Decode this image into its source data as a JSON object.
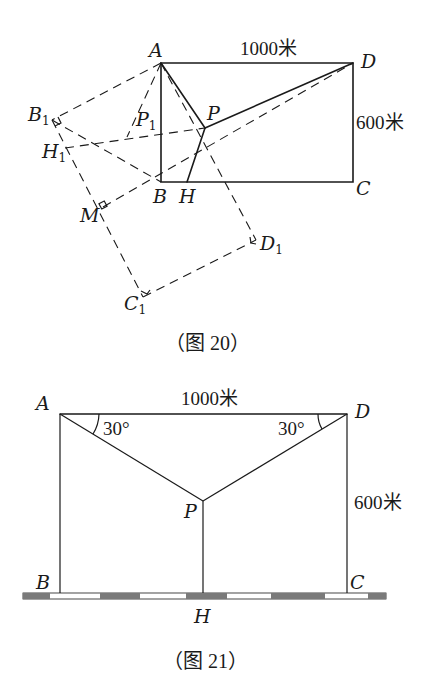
{
  "figure20": {
    "caption": "（图 20）",
    "labels": {
      "A": "A",
      "B": "B",
      "C": "C",
      "D": "D",
      "P": "P",
      "H": "H",
      "B1": "B",
      "H1": "H",
      "P1": "P",
      "C1": "C",
      "D1": "D",
      "M": "M",
      "sub1": "1"
    },
    "top_length": "1000米",
    "side_length": "600米"
  },
  "figure21": {
    "caption": "（图 21）",
    "labels": {
      "A": "A",
      "B": "B",
      "C": "C",
      "D": "D",
      "P": "P",
      "H": "H"
    },
    "top_length": "1000米",
    "side_length": "600米",
    "angle_left": "30°",
    "angle_right": "30°"
  },
  "colors": {
    "line": "#1a1a1a",
    "ground_dark": "#7a7a7a",
    "ground_light": "#ffffff"
  }
}
